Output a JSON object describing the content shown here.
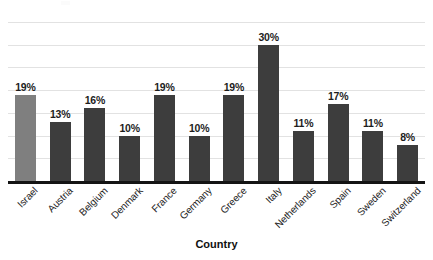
{
  "chart_data": {
    "type": "bar",
    "title": "",
    "xlabel": "Country",
    "ylabel": "",
    "categories": [
      "Israel",
      "Austria",
      "Belgium",
      "Denmark",
      "France",
      "Germany",
      "Greece",
      "Italy",
      "Netherlands",
      "Spain",
      "Sweden",
      "Switzerland"
    ],
    "values": [
      19,
      13,
      16,
      10,
      19,
      10,
      19,
      30,
      11,
      17,
      11,
      8
    ],
    "value_labels": [
      "19%",
      "13%",
      "16%",
      "10%",
      "19%",
      "10%",
      "19%",
      "30%",
      "11%",
      "17%",
      "11%",
      "8%"
    ],
    "ylim": [
      0,
      35
    ],
    "y_tick_values": [
      0,
      5,
      10,
      15,
      20,
      25,
      30,
      35
    ],
    "y_tick_labels_visible": false,
    "grid": true,
    "grid_orientation": "horizontal",
    "legend": false,
    "legend_position": "none",
    "bar_colors": [
      "#7f7f7f",
      "#3d3d3d",
      "#3d3d3d",
      "#3d3d3d",
      "#3d3d3d",
      "#3d3d3d",
      "#3d3d3d",
      "#3d3d3d",
      "#3d3d3d",
      "#3d3d3d",
      "#3d3d3d",
      "#3d3d3d"
    ],
    "highlight_category": "Israel",
    "axis_color": "#141414",
    "gridline_color": "#e2e2e2",
    "label_rotation_degrees": -45
  },
  "axis": {
    "x_title": "Country"
  }
}
